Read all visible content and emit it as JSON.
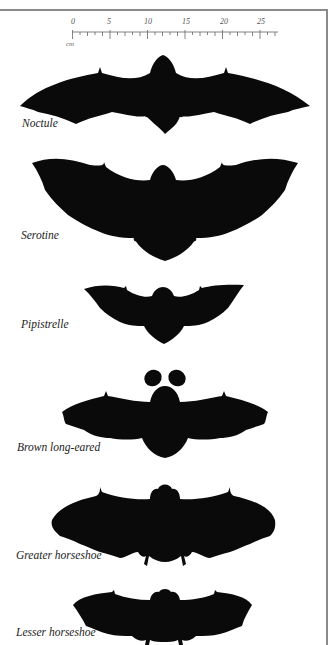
{
  "figure": {
    "scale": {
      "unit": "cm",
      "tick_labels": [
        "0",
        "5",
        "10",
        "15",
        "20",
        "25"
      ],
      "max": 26
    },
    "colors": {
      "silhouette": "#0a0a0a",
      "frame": "#8a8a8a",
      "label": "#222222"
    },
    "bats": [
      {
        "id": "noctule",
        "label": "Noctule"
      },
      {
        "id": "serotine",
        "label": "Serotine"
      },
      {
        "id": "pipistrelle",
        "label": "Pipistrelle"
      },
      {
        "id": "brown-long-eared",
        "label": "Brown long-eared"
      },
      {
        "id": "greater-horseshoe",
        "label": "Greater horseshoe"
      },
      {
        "id": "lesser-horseshoe",
        "label": "Lesser horseshoe"
      }
    ]
  }
}
